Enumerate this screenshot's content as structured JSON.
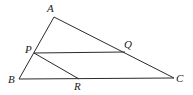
{
  "diagram": {
    "type": "geometry-triangle",
    "points": {
      "A": {
        "x": 54,
        "y": 17,
        "label": "A",
        "lx": 47,
        "ly": 12
      },
      "B": {
        "x": 19,
        "y": 79,
        "label": "B",
        "lx": 8,
        "ly": 83
      },
      "C": {
        "x": 174,
        "y": 78,
        "label": "C",
        "lx": 176,
        "ly": 82
      },
      "P": {
        "x": 34,
        "y": 53,
        "label": "P",
        "lx": 25,
        "ly": 53
      },
      "Q": {
        "x": 125,
        "y": 52,
        "label": "Q",
        "lx": 124,
        "ly": 48
      },
      "R": {
        "x": 79,
        "y": 79,
        "label": "R",
        "lx": 74,
        "ly": 90
      }
    },
    "segments": [
      {
        "from": "A",
        "to": "B",
        "name": "side-AB"
      },
      {
        "from": "A",
        "to": "C",
        "name": "side-AC"
      },
      {
        "from": "B",
        "to": "C",
        "name": "side-BC"
      },
      {
        "from": "P",
        "to": "Q",
        "name": "segment-PQ"
      },
      {
        "from": "P",
        "to": "R",
        "name": "segment-PR"
      }
    ],
    "labels": {
      "A": "A",
      "B": "B",
      "C": "C",
      "P": "P",
      "Q": "Q",
      "R": "R"
    }
  }
}
